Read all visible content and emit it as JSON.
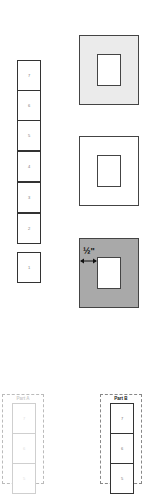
{
  "stack": {
    "cells": [
      "7",
      "6",
      "5",
      "4",
      "3",
      "2"
    ],
    "separate_cell": "1"
  },
  "squares": [
    {
      "name": "light-gray-frame",
      "fill": "#ebebeb"
    },
    {
      "name": "white-frame",
      "fill": "#ffffff"
    },
    {
      "name": "dark-gray-frame",
      "fill": "#a9a9a9",
      "measurement": "½\""
    }
  ],
  "parts": [
    {
      "label": "Part A",
      "cells": [
        "7",
        "6",
        "5"
      ],
      "faded": true
    },
    {
      "label": "Part B",
      "cells": [
        "7",
        "6",
        "5"
      ],
      "faded": false
    }
  ]
}
